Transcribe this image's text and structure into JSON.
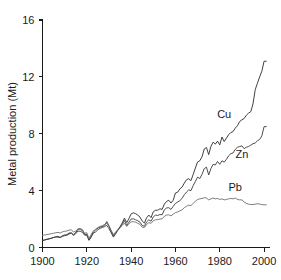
{
  "chart_data": {
    "type": "line",
    "title": "",
    "xlabel": "",
    "ylabel": "Metal production (Mt)",
    "xlim": [
      1900,
      2002
    ],
    "ylim": [
      0,
      16
    ],
    "grid": false,
    "legend_position": "inline-annotations",
    "xticks": [
      1900,
      1920,
      1940,
      1960,
      1980,
      2000
    ],
    "xticklabels": [
      "1900",
      "1920",
      "1940",
      "1960",
      "1980",
      "2000"
    ],
    "yticks": [
      0,
      4,
      8,
      12,
      16
    ],
    "yticklabels": [
      "0",
      "4",
      "8",
      "12",
      "16"
    ],
    "x": [
      1900,
      1901,
      1902,
      1903,
      1904,
      1905,
      1906,
      1907,
      1908,
      1909,
      1910,
      1911,
      1912,
      1913,
      1914,
      1915,
      1916,
      1917,
      1918,
      1919,
      1920,
      1921,
      1922,
      1923,
      1924,
      1925,
      1926,
      1927,
      1928,
      1929,
      1930,
      1931,
      1932,
      1933,
      1934,
      1935,
      1936,
      1937,
      1938,
      1939,
      1940,
      1941,
      1942,
      1943,
      1944,
      1945,
      1946,
      1947,
      1948,
      1949,
      1950,
      1951,
      1952,
      1953,
      1954,
      1955,
      1956,
      1957,
      1958,
      1959,
      1960,
      1961,
      1962,
      1963,
      1964,
      1965,
      1966,
      1967,
      1968,
      1969,
      1970,
      1971,
      1972,
      1973,
      1974,
      1975,
      1976,
      1977,
      1978,
      1979,
      1980,
      1981,
      1982,
      1983,
      1984,
      1985,
      1986,
      1987,
      1988,
      1989,
      1990,
      1991,
      1992,
      1993,
      1994,
      1995,
      1996,
      1997,
      1998,
      1999,
      2000,
      2001
    ],
    "series": [
      {
        "name": "Cu",
        "label": "Cu",
        "color": "#2b2b2b",
        "end_value": 13.1,
        "values": [
          0.5,
          0.54,
          0.58,
          0.61,
          0.66,
          0.71,
          0.75,
          0.73,
          0.72,
          0.83,
          0.88,
          0.9,
          1.02,
          1.03,
          0.9,
          1.05,
          1.3,
          1.32,
          1.25,
          0.93,
          0.92,
          0.53,
          0.82,
          1.1,
          1.25,
          1.37,
          1.44,
          1.47,
          1.56,
          1.82,
          1.53,
          1.13,
          0.83,
          1.05,
          1.26,
          1.46,
          1.73,
          2.07,
          1.75,
          2.03,
          2.36,
          2.44,
          2.38,
          2.28,
          2.14,
          1.86,
          1.72,
          2.1,
          2.28,
          2.1,
          2.51,
          2.62,
          2.62,
          2.72,
          2.68,
          3.05,
          3.24,
          3.32,
          3.13,
          3.33,
          3.83,
          3.89,
          4.12,
          4.25,
          4.53,
          4.77,
          4.84,
          4.7,
          5.14,
          5.59,
          6.02,
          6.1,
          6.38,
          6.93,
          7.03,
          6.53,
          7.1,
          7.41,
          7.27,
          7.48,
          7.22,
          7.77,
          7.45,
          7.69,
          7.93,
          8.09,
          8.15,
          8.4,
          8.56,
          8.86,
          8.98,
          9.07,
          9.3,
          9.45,
          9.55,
          10.1,
          11.1,
          11.55,
          12.0,
          12.4,
          13.1,
          13.1
        ]
      },
      {
        "name": "Zn",
        "label": "Zn",
        "color": "#3a3a3a",
        "end_value": 8.5,
        "values": [
          0.48,
          0.52,
          0.57,
          0.61,
          0.65,
          0.7,
          0.74,
          0.78,
          0.7,
          0.78,
          0.83,
          0.86,
          0.95,
          1.0,
          0.85,
          0.97,
          1.16,
          1.14,
          1.07,
          0.87,
          0.86,
          0.5,
          0.74,
          1.02,
          1.1,
          1.25,
          1.35,
          1.41,
          1.47,
          1.56,
          1.33,
          1.03,
          0.73,
          0.95,
          1.2,
          1.4,
          1.63,
          1.9,
          1.55,
          1.78,
          2.0,
          2.02,
          1.95,
          1.88,
          1.78,
          1.55,
          1.5,
          1.8,
          1.95,
          1.85,
          2.15,
          2.28,
          2.25,
          2.32,
          2.3,
          2.65,
          2.78,
          2.8,
          2.68,
          2.9,
          3.1,
          3.2,
          3.3,
          3.45,
          3.72,
          3.9,
          4.05,
          4.0,
          4.35,
          4.65,
          4.95,
          4.85,
          5.15,
          5.55,
          5.65,
          5.1,
          5.55,
          5.85,
          5.8,
          6.05,
          5.85,
          6.1,
          6.0,
          6.2,
          6.45,
          6.6,
          6.65,
          6.9,
          7.05,
          7.1,
          7.15,
          6.95,
          7.05,
          7.1,
          7.2,
          7.3,
          7.35,
          7.5,
          7.6,
          7.85,
          8.5,
          8.5
        ]
      },
      {
        "name": "Pb",
        "label": "Pb",
        "color": "#6e6e6e",
        "end_value": 3.0,
        "values": [
          0.85,
          0.88,
          0.91,
          0.94,
          0.97,
          1.0,
          1.04,
          1.06,
          1.02,
          1.1,
          1.14,
          1.16,
          1.22,
          1.25,
          1.08,
          1.16,
          1.3,
          1.27,
          1.18,
          1.0,
          1.04,
          0.62,
          0.92,
          1.18,
          1.28,
          1.4,
          1.48,
          1.54,
          1.62,
          1.7,
          1.5,
          1.2,
          0.92,
          1.08,
          1.24,
          1.4,
          1.55,
          1.72,
          1.48,
          1.68,
          1.8,
          1.82,
          1.78,
          1.7,
          1.62,
          1.42,
          1.4,
          1.62,
          1.75,
          1.7,
          1.88,
          1.95,
          1.96,
          2.0,
          2.02,
          2.2,
          2.28,
          2.3,
          2.22,
          2.35,
          2.45,
          2.5,
          2.58,
          2.65,
          2.8,
          2.9,
          2.98,
          2.95,
          3.1,
          3.25,
          3.38,
          3.42,
          3.45,
          3.5,
          3.48,
          3.35,
          3.42,
          3.48,
          3.42,
          3.45,
          3.38,
          3.42,
          3.35,
          3.38,
          3.42,
          3.45,
          3.42,
          3.48,
          3.38,
          3.35,
          3.35,
          3.2,
          3.1,
          3.05,
          3.02,
          3.02,
          3.05,
          3.08,
          3.05,
          3.02,
          3.0,
          3.0
        ]
      }
    ],
    "annotations": [
      {
        "text": "Cu",
        "x": 1982,
        "y": 9.1
      },
      {
        "text": "Zn",
        "x": 1990,
        "y": 6.3
      },
      {
        "text": "Pb",
        "x": 1987,
        "y": 4.0
      }
    ]
  },
  "axes": {
    "ylabel": "Metal production (Mt)"
  }
}
